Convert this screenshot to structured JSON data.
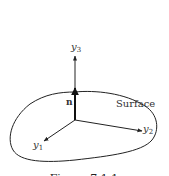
{
  "figure": {
    "axes": {
      "y1": {
        "label": "y",
        "subscript": "1"
      },
      "y2": {
        "label": "y",
        "subscript": "2"
      },
      "y3": {
        "label": "y",
        "subscript": "3"
      }
    },
    "normal_label": "n",
    "surface_label": "Surface",
    "caption": "Figure 7.1.1",
    "colors": {
      "stroke": "#222222",
      "background": "#ffffff"
    }
  }
}
